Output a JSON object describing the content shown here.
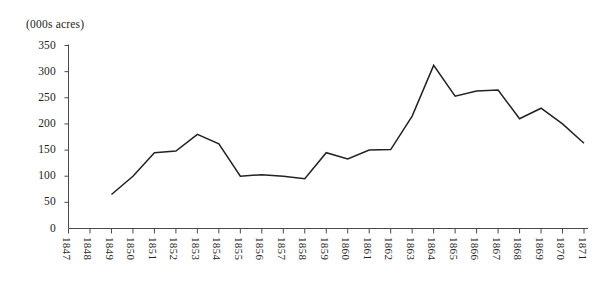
{
  "figure": {
    "clipped_title": "",
    "unit_label": "(000s acres)"
  },
  "chart_data": {
    "type": "line",
    "title": "",
    "subtitle": "",
    "xlabel": "",
    "ylabel": "(000s acres)",
    "ylim": [
      0,
      350
    ],
    "xlim": [
      "1847",
      "1871"
    ],
    "grid": false,
    "legend": "none",
    "yticks": [
      0,
      50,
      100,
      150,
      200,
      250,
      300,
      350
    ],
    "ytick_labels": [
      "0",
      "50",
      "100",
      "150",
      "200",
      "250",
      "300",
      "350"
    ],
    "categories": [
      "1847",
      "1848",
      "1849",
      "1850",
      "1851",
      "1852",
      "1853",
      "1854",
      "1855",
      "1856",
      "1857",
      "1858",
      "1859",
      "1860",
      "1861",
      "1862",
      "1863",
      "1864",
      "1865",
      "1866",
      "1867",
      "1868",
      "1869",
      "1870",
      "1871"
    ],
    "x": [
      1847,
      1848,
      1849,
      1850,
      1851,
      1852,
      1853,
      1854,
      1855,
      1856,
      1857,
      1858,
      1859,
      1860,
      1861,
      1862,
      1863,
      1864,
      1865,
      1866,
      1867,
      1868,
      1869,
      1870,
      1871
    ],
    "values": [
      null,
      null,
      65,
      100,
      145,
      148,
      180,
      162,
      100,
      103,
      100,
      95,
      145,
      133,
      150,
      151,
      215,
      312,
      253,
      263,
      265,
      210,
      230,
      200,
      163
    ],
    "series": [
      {
        "name": "acres",
        "color": "#222222",
        "values": [
          null,
          null,
          65,
          100,
          145,
          148,
          180,
          162,
          100,
          103,
          100,
          95,
          145,
          133,
          150,
          151,
          215,
          312,
          253,
          263,
          265,
          210,
          230,
          200,
          163
        ]
      }
    ],
    "annotations": []
  }
}
